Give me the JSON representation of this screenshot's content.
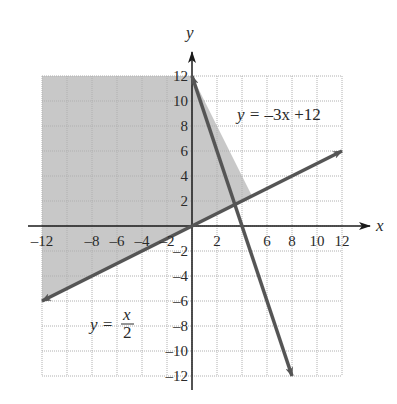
{
  "chart_data": {
    "type": "line",
    "title": "",
    "xlabel": "x",
    "ylabel": "y",
    "xlim": [
      -12,
      12
    ],
    "ylim": [
      -12,
      12
    ],
    "grid": true,
    "grid_step": 2,
    "x_ticks": [
      "-12",
      "-8",
      "-6",
      "-4",
      "-2",
      "2",
      "6",
      "8",
      "10",
      "12"
    ],
    "y_ticks": [
      "12",
      "10",
      "8",
      "6",
      "4",
      "2",
      "-2",
      "-4",
      "-6",
      "-8",
      "-10",
      "-12"
    ],
    "series": [
      {
        "name": "y = -3x + 12",
        "equation": "y = -3x + 12",
        "points": [
          [
            0,
            12
          ],
          [
            8,
            -12
          ]
        ],
        "arrows": "both"
      },
      {
        "name": "y = x/2",
        "equation": "y = x/2",
        "points": [
          [
            -12,
            -6
          ],
          [
            12,
            6
          ]
        ],
        "arrows": "both"
      }
    ],
    "shaded_region": {
      "description": "Region satisfying y >= x/2 and y <= -3x + 12 (left side)",
      "vertices": [
        [
          -12,
          -6
        ],
        [
          -12,
          12
        ],
        [
          0,
          12
        ],
        [
          4.8,
          2.4
        ]
      ],
      "color": "#c8c8c8"
    },
    "intersection": [
      4.8,
      2.4
    ],
    "annotations": [
      {
        "text": "y = -3x + 12",
        "x": 8,
        "y": 10
      },
      {
        "text": "y = x/2",
        "x": -6,
        "y": -7
      }
    ]
  },
  "labels": {
    "x_axis": "x",
    "y_axis": "y",
    "eq1_lhs": "y = ",
    "eq1_rhs": "–3x +12",
    "eq2_lhs": "y = ",
    "eq2_num": "x",
    "eq2_den": "2"
  },
  "colors": {
    "line": "#555555",
    "axis": "#1a1a1a",
    "shade": "#c8c8c8",
    "grid": "#b0b0b0"
  }
}
